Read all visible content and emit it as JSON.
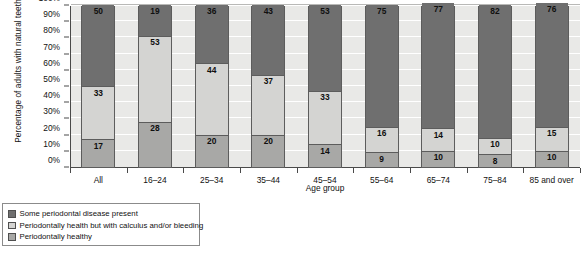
{
  "chart_data": {
    "type": "bar",
    "subtype": "stacked-bar-100",
    "title": "",
    "xlabel": "Age group",
    "ylabel": "Percentage of adults with natural teeth",
    "ylim": [
      0,
      100
    ],
    "ytick_labels": [
      "0%",
      "10%",
      "20%",
      "30%",
      "40%",
      "50%",
      "60%",
      "70%",
      "80%",
      "90%",
      "100%"
    ],
    "ytick_values": [
      0,
      10,
      20,
      30,
      40,
      50,
      60,
      70,
      80,
      90,
      100
    ],
    "grid": true,
    "legend_position": "below-left",
    "categories": [
      "All",
      "16–24",
      "25–34",
      "35–44",
      "45–54",
      "55–64",
      "65–74",
      "75–84",
      "85 and over"
    ],
    "series": [
      {
        "name": "Periodontally healthy",
        "color": "#a8a8a6",
        "values": [
          17,
          28,
          20,
          20,
          14,
          9,
          10,
          8,
          10
        ]
      },
      {
        "name": "Periodontally health but with calculus and/or bleeding",
        "color": "#d4d4d2",
        "values": [
          33,
          53,
          44,
          37,
          33,
          16,
          14,
          10,
          15
        ]
      },
      {
        "name": "Some periodontal disease present",
        "color": "#6f6f6f",
        "values": [
          50,
          19,
          36,
          43,
          53,
          75,
          77,
          82,
          76
        ]
      }
    ],
    "stack_order_bottom_to_top": [
      "Periodontally healthy",
      "Periodontally health but with calculus and/or bleeding",
      "Some periodontal disease present"
    ]
  },
  "legend": {
    "items": [
      {
        "label": "Some periodontal disease present",
        "swatch_class": "sw-disease"
      },
      {
        "label": "Periodontally health but with calculus and/or bleeding",
        "swatch_class": "sw-calculus"
      },
      {
        "label": "Periodontally healthy",
        "swatch_class": "sw-healthy"
      }
    ]
  },
  "colors": {
    "plot_background": "#e9e9e7",
    "gridline": "#ffffff",
    "axis": "#4a4a4a",
    "disease": "#6f6f6f",
    "calculus": "#d4d4d2",
    "healthy": "#a8a8a6"
  }
}
